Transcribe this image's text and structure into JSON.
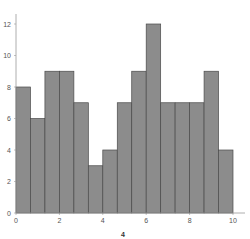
{
  "chart_data": {
    "type": "bar",
    "subtype": "histogram",
    "title": "",
    "xlabel": "4",
    "ylabel": "",
    "bin_edges": [
      0,
      0.667,
      1.333,
      2.0,
      2.667,
      3.333,
      4.0,
      4.667,
      5.333,
      6.0,
      6.667,
      7.333,
      8.0,
      8.667,
      9.333,
      10.0
    ],
    "values": [
      8,
      6,
      9,
      9,
      7,
      3,
      4,
      7,
      9,
      12,
      7,
      7,
      7,
      9,
      4
    ],
    "xlim": [
      0,
      10.5
    ],
    "ylim": [
      0,
      12.5
    ],
    "xticks": [
      "0",
      "2",
      "4",
      "6",
      "8",
      "10"
    ],
    "yticks": [
      "0",
      "2",
      "4",
      "6",
      "8",
      "10",
      "12"
    ],
    "grid": false,
    "legend": null,
    "colors": {
      "bar_fill": "#8c8c8c",
      "bar_edge": "#4a4a4a",
      "axis": "#999999"
    }
  }
}
